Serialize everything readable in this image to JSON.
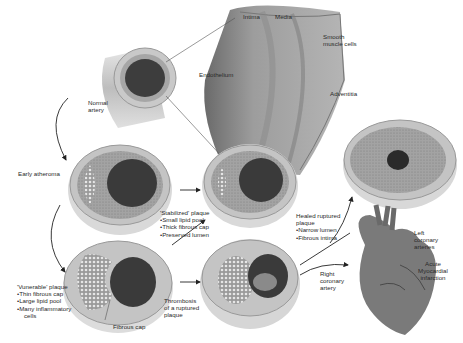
{
  "labels": {
    "intima": "Intima",
    "media": "Media",
    "smooth_muscle": [
      "Smooth",
      "muscle cells"
    ],
    "endothelium": "Endothelium",
    "adventitia": "Adventitia",
    "normal_artery": [
      "Normal",
      "artery"
    ],
    "early_atheroma": "Early atheroma",
    "stabilized": {
      "title": "'Stabilized' plaque",
      "items": [
        "Small lipid pool",
        "Thick fibrous cap",
        "Preserved lumen"
      ]
    },
    "vulnerable": {
      "title": "'Vunerable' plaque",
      "items": [
        "Thin fibrous cap",
        "Large lipid pool",
        "Many inflammatory",
        "cells"
      ]
    },
    "fibrous_cap": "Fibrous cap",
    "thrombosis": [
      "Thrombosis",
      "of a ruptured",
      "plaque"
    ],
    "healed": {
      "title": [
        "Healed ruptured",
        "plaque"
      ],
      "items": [
        "Narrow lumen",
        "Fibrous intima"
      ]
    },
    "left_coronary": [
      "Left",
      "coronary",
      "arteries"
    ],
    "right_coronary": [
      "Right",
      "coronary",
      "artery"
    ],
    "acute_mi": [
      "Acute",
      "Myocardial",
      "infarction"
    ]
  },
  "colors": {
    "wall": "#b8b8b8",
    "wall_dark": "#8a8a8a",
    "lumen": "#3a3a3a",
    "lipid": "#d6d6d6",
    "heart": "#7a7a7a",
    "arrow": "#222222"
  }
}
